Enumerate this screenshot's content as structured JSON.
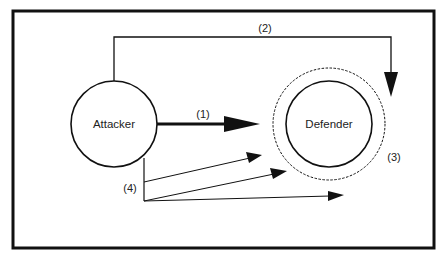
{
  "diagram": {
    "colors": {
      "stroke": "#111111",
      "background": "#ffffff",
      "text": "#222222"
    },
    "nodes": [
      {
        "id": "attacker",
        "label": "Attacker",
        "shape": "circle"
      },
      {
        "id": "defender",
        "label": "Defender",
        "shape": "circle",
        "boundary": "dashed-ring"
      }
    ],
    "edges": [
      {
        "id": "e1",
        "label": "(1)",
        "from": "attacker",
        "to": "defender",
        "style": "thick",
        "description": "direct attack"
      },
      {
        "id": "e2",
        "label": "(2)",
        "from": "attacker",
        "to": "defender",
        "style": "routed-over-top",
        "description": "indirect attack over the top"
      },
      {
        "id": "e4",
        "label": "(4)",
        "from": "attacker",
        "to": "defender",
        "style": "thin-fan",
        "count": 3,
        "description": "multiple scattered attacks"
      }
    ],
    "annotations": [
      {
        "id": "a3",
        "label": "(3)",
        "target": "defender-boundary"
      }
    ]
  }
}
